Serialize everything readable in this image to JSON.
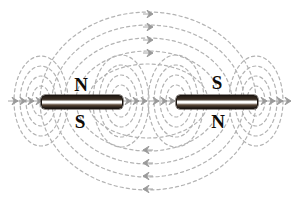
{
  "figure": {
    "background_color": "#ffffff",
    "width": 294,
    "height": 212
  },
  "colors": {
    "field_line": "#b3b3b3",
    "arrow": "#9a9a9a",
    "magnet_dark": "#1d1712",
    "magnet_light": "#ffffff",
    "label_text": "#100c08"
  },
  "magnets": [
    {
      "id": "left-magnet",
      "name": "left-bar-magnet",
      "x": 41,
      "y": 95,
      "width": 80,
      "height": 12,
      "top_pole": "N",
      "bottom_pole": "S",
      "top_label_x": 70,
      "top_label_y": 75,
      "bottom_label_x": 69,
      "bottom_label_y": 112
    },
    {
      "id": "right-magnet",
      "name": "right-bar-magnet",
      "x": 176,
      "y": 95,
      "width": 80,
      "height": 12,
      "top_pole": "S",
      "bottom_pole": "N",
      "top_label_x": 206,
      "top_label_y": 73,
      "bottom_label_x": 207,
      "bottom_label_y": 112
    }
  ],
  "field": {
    "style": "dashed",
    "dash_pattern": "3.2 3.0",
    "stroke_width": 1.2,
    "axis_y": 101,
    "center_x": 148,
    "outer_loops": {
      "count": 5,
      "description": "Large dashed loops enclosing both magnets, arrowheads on vertical centre line",
      "top_arrow_direction": "right",
      "bottom_arrow_direction": "left",
      "radii_x": [
        108,
        96,
        84,
        72,
        60
      ],
      "radii_y": [
        89,
        76,
        63,
        50,
        37
      ]
    },
    "left_end_loops": {
      "count": 4,
      "description": "Concentric dashed loops around left (outer) end of left magnet",
      "arrow_direction": "right",
      "cx": 41,
      "radii_x": [
        27,
        21,
        15,
        9
      ],
      "radii_y": [
        45,
        35,
        25,
        15
      ]
    },
    "inner_left_loops": {
      "count": 4,
      "description": "Concentric dashed loops around inner end of left magnet",
      "arrow_direction": "right",
      "cx": 121,
      "radii_x": [
        28,
        22,
        16,
        10
      ],
      "radii_y": [
        46,
        36,
        26,
        16
      ]
    },
    "inner_right_loops": {
      "count": 4,
      "description": "Concentric dashed loops around inner end of right magnet",
      "arrow_direction": "right",
      "cx": 176,
      "radii_x": [
        28,
        22,
        16,
        10
      ],
      "radii_y": [
        46,
        36,
        26,
        16
      ]
    },
    "right_end_loops": {
      "count": 4,
      "description": "Concentric dashed loops around right (outer) end of right magnet",
      "arrow_direction": "right",
      "cx": 256,
      "radii_x": [
        27,
        21,
        15,
        9
      ],
      "radii_y": [
        45,
        35,
        25,
        15
      ]
    },
    "arrow_rows": {
      "top_y": [
        14,
        27,
        40,
        53
      ],
      "bottom_y": [
        150,
        163,
        176,
        189
      ],
      "axis_left_x": [
        13,
        21,
        29,
        37
      ],
      "axis_inner_left_x": [
        126,
        134,
        142
      ],
      "axis_inner_right_x": [
        154,
        162,
        170
      ],
      "axis_right_x": [
        262,
        270,
        278,
        286
      ]
    }
  }
}
